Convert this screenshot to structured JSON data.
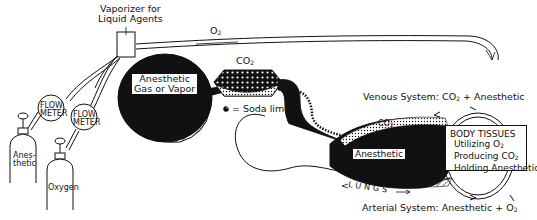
{
  "diagram": {
    "labels": {
      "vaporizer_line1": "Vaporizer for",
      "vaporizer_line2": "Liquid Agents",
      "o2_supply": "O2",
      "flow_meter_1_line1": "FLOW",
      "flow_meter_1_line2": "METER",
      "flow_meter_2_line1": "FLOW",
      "flow_meter_2_line2": "METER",
      "tank_anesthetic_line1": "Anes-",
      "tank_anesthetic_line2": "thetic",
      "tank_oxygen": "Oxygen",
      "bag_line1": "Anesthetic",
      "bag_line2": "Gas or Vapor",
      "bag_o2": "O2",
      "canister_co2": "CO2",
      "soda_lime_legend": "= Soda lime",
      "venous_system": "Venous System: CO2 + Anesthetic",
      "lungs_anesthetic": "Anesthetic",
      "lungs_co2": "CO2",
      "lungs_o2": "O2",
      "lungs": "LUNGS",
      "arterial_system": "Arterial System: Anesthetic + O2"
    },
    "body_tissues": {
      "title": "BODY TISSUES",
      "lines": [
        "Utilizing O2",
        "Producing CO2",
        "Holding Anesthetic"
      ]
    },
    "colors": {
      "ink": "#111111",
      "paper": "#ffffff"
    }
  }
}
